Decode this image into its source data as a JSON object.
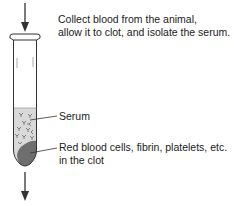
{
  "diagram": {
    "step_instruction": {
      "line1": "Collect blood from the animal,",
      "line2": "allow it to clot, and isolate the serum."
    },
    "labels": {
      "serum": "Serum",
      "clot_line1": "Red blood cells, fibrin, platelets, etc.",
      "clot_line2": "in the clot"
    },
    "colors": {
      "outline": "#333333",
      "serum_fill": "#d9d9d9",
      "clot_fill": "#707070",
      "text": "#222222"
    },
    "icons": {
      "top_arrow": "arrow-down-icon",
      "bottom_arrow": "arrow-down-icon"
    }
  }
}
